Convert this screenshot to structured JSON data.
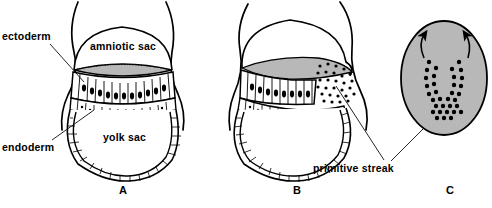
{
  "figure": {
    "background_color": "#ffffff",
    "ink_color": "#000000",
    "shade_color": "#b8b8b8",
    "width": 492,
    "height": 208
  },
  "labels": {
    "ectoderm": "ectoderm",
    "endoderm": "endoderm",
    "amniotic_sac": "amniotic sac",
    "yolk_sac": "yolk sac",
    "primitive_streak": "primitive streak"
  },
  "panels": [
    {
      "letter": "A",
      "name": "bilaminar-embryonic-disc",
      "description": "Sagittal section: amniotic sac above, yolk sac below, bilaminar disc between",
      "callouts": [
        "ectoderm",
        "endoderm",
        "amniotic sac",
        "yolk sac"
      ]
    },
    {
      "letter": "B",
      "name": "primitive-streak-formation",
      "description": "Same section with cells migrating through the primitive streak",
      "callouts": [
        "primitive streak"
      ]
    },
    {
      "letter": "C",
      "name": "dorsal-view-embryonic-disc",
      "description": "Dorsal surface view of the disc showing the primitive streak and direction of cell migration",
      "callouts": [
        "primitive streak"
      ]
    }
  ],
  "annotations": {
    "arrows": [
      {
        "name": "migration-arrow-left",
        "direction": "up-left-curving"
      },
      {
        "name": "migration-arrow-right",
        "direction": "up-right-curving"
      }
    ]
  }
}
